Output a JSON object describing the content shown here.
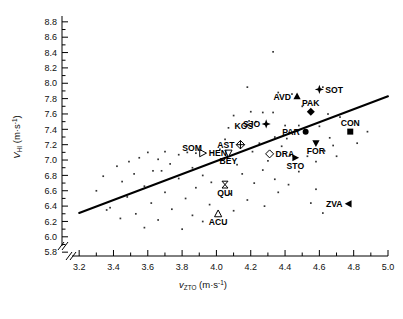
{
  "chart_data": {
    "type": "scatter",
    "title": "",
    "xlabel": "v_ZTO (m·s⁻¹)",
    "ylabel": "V_HI (m·s⁻¹)",
    "xlabel_parts": {
      "main": "v",
      "sub": "ZTO",
      "units": " (m·s",
      "sup": "-1",
      "close": ")"
    },
    "ylabel_parts": {
      "main": "V",
      "sub": "HI",
      "units": " (m·s",
      "sup": "-1",
      "close": ")"
    },
    "xlim": [
      3.1,
      5.0
    ],
    "ylim": [
      5.75,
      8.85
    ],
    "xticks": [
      3.2,
      3.4,
      3.6,
      3.8,
      4.0,
      4.2,
      4.4,
      4.6,
      4.8,
      5.0
    ],
    "xtick_labels": [
      "3.2",
      "3.4",
      "3.6",
      "3.8",
      "4.0",
      "4.2",
      "4.4",
      "4.6",
      "4.8",
      "5.0"
    ],
    "yticks": [
      5.8,
      6.0,
      6.2,
      6.4,
      6.6,
      6.8,
      7.0,
      7.2,
      7.4,
      7.6,
      7.8,
      8.0,
      8.2,
      8.4,
      8.6,
      8.8
    ],
    "ytick_labels": [
      "5.8",
      "6.0",
      "6.2",
      "6.4",
      "6.6",
      "6.8",
      "7.0",
      "7.2",
      "7.4",
      "7.6",
      "7.8",
      "8.0",
      "8.2",
      "8.4",
      "8.6",
      "8.8"
    ],
    "grid": false,
    "legend": "none",
    "axis_break": true,
    "trend_line": {
      "x0": 3.2,
      "y0": 6.31,
      "x1": 5.0,
      "y1": 7.83,
      "width": 2
    },
    "highlighted": [
      {
        "label": "SOT",
        "x": 4.6,
        "y": 7.92,
        "marker": "star-filled",
        "label_pos": "right"
      },
      {
        "label": "AVD",
        "x": 4.47,
        "y": 7.83,
        "marker": "triangle-up-filled",
        "label_pos": "left"
      },
      {
        "label": "PAK",
        "x": 4.55,
        "y": 7.63,
        "marker": "diamond-filled",
        "label_pos": "above"
      },
      {
        "label": "CON",
        "x": 4.78,
        "y": 7.37,
        "marker": "square-filled",
        "label_pos": "above"
      },
      {
        "label": "PAR",
        "x": 4.52,
        "y": 7.37,
        "marker": "circle-filled",
        "label_pos": "left"
      },
      {
        "label": "FOR",
        "x": 4.58,
        "y": 7.22,
        "marker": "triangle-down-filled",
        "label_pos": "below"
      },
      {
        "label": "SJO",
        "x": 4.29,
        "y": 7.47,
        "marker": "star-filled",
        "label_pos": "left"
      },
      {
        "label": "KOS",
        "x": 4.16,
        "y": 7.33,
        "marker": "none",
        "label_pos": "above"
      },
      {
        "label": "AST",
        "x": 4.14,
        "y": 7.2,
        "marker": "diamond-cross",
        "label_pos": "left"
      },
      {
        "label": "SOM",
        "x": 3.95,
        "y": 7.16,
        "marker": "none",
        "label_pos": "left"
      },
      {
        "label": "HEN",
        "x": 3.92,
        "y": 7.09,
        "marker": "triangle-right-open",
        "label_pos": "right"
      },
      {
        "label": "BEY",
        "x": 4.07,
        "y": 7.09,
        "marker": "triangle-down-open",
        "label_pos": "below"
      },
      {
        "label": "DRA",
        "x": 4.31,
        "y": 7.08,
        "marker": "diamond-open",
        "label_pos": "right"
      },
      {
        "label": "STO",
        "x": 4.46,
        "y": 7.03,
        "marker": "triangle-right-filled",
        "label_pos": "below"
      },
      {
        "label": "QUI",
        "x": 4.05,
        "y": 6.68,
        "marker": "bowtie-open",
        "label_pos": "below"
      },
      {
        "label": "ACU",
        "x": 4.01,
        "y": 6.3,
        "marker": "triangle-up-open",
        "label_pos": "below"
      },
      {
        "label": "ZVA",
        "x": 4.77,
        "y": 6.43,
        "marker": "triangle-left-filled",
        "label_pos": "left"
      }
    ],
    "background_points": [
      {
        "x": 4.33,
        "y": 8.41
      },
      {
        "x": 4.18,
        "y": 7.95
      },
      {
        "x": 4.07,
        "y": 7.42
      },
      {
        "x": 4.36,
        "y": 7.88
      },
      {
        "x": 4.44,
        "y": 7.86
      },
      {
        "x": 4.62,
        "y": 7.95
      },
      {
        "x": 4.5,
        "y": 7.7
      },
      {
        "x": 4.2,
        "y": 7.63
      },
      {
        "x": 4.27,
        "y": 7.62
      },
      {
        "x": 4.33,
        "y": 7.62
      },
      {
        "x": 4.1,
        "y": 7.58
      },
      {
        "x": 4.19,
        "y": 7.51
      },
      {
        "x": 4.23,
        "y": 7.5
      },
      {
        "x": 4.65,
        "y": 7.6
      },
      {
        "x": 4.72,
        "y": 7.56
      },
      {
        "x": 4.4,
        "y": 7.45
      },
      {
        "x": 4.48,
        "y": 7.45
      },
      {
        "x": 4.6,
        "y": 7.44
      },
      {
        "x": 4.88,
        "y": 7.37
      },
      {
        "x": 4.34,
        "y": 7.3
      },
      {
        "x": 4.41,
        "y": 7.28
      },
      {
        "x": 4.66,
        "y": 7.29
      },
      {
        "x": 4.05,
        "y": 7.27
      },
      {
        "x": 4.25,
        "y": 7.22
      },
      {
        "x": 4.38,
        "y": 7.18
      },
      {
        "x": 4.68,
        "y": 7.19
      },
      {
        "x": 4.02,
        "y": 7.14
      },
      {
        "x": 4.21,
        "y": 7.11
      },
      {
        "x": 4.63,
        "y": 7.12
      },
      {
        "x": 3.83,
        "y": 7.1
      },
      {
        "x": 3.88,
        "y": 7.09
      },
      {
        "x": 3.7,
        "y": 7.11
      },
      {
        "x": 3.6,
        "y": 7.1
      },
      {
        "x": 3.78,
        "y": 7.07
      },
      {
        "x": 4.43,
        "y": 7.06
      },
      {
        "x": 4.53,
        "y": 7.05
      },
      {
        "x": 3.55,
        "y": 7.03
      },
      {
        "x": 3.66,
        "y": 7.01
      },
      {
        "x": 3.49,
        "y": 6.98
      },
      {
        "x": 3.73,
        "y": 6.95
      },
      {
        "x": 4.3,
        "y": 6.99
      },
      {
        "x": 4.58,
        "y": 6.98
      },
      {
        "x": 3.42,
        "y": 6.92
      },
      {
        "x": 3.86,
        "y": 6.9
      },
      {
        "x": 4.12,
        "y": 6.94
      },
      {
        "x": 3.63,
        "y": 6.86
      },
      {
        "x": 3.68,
        "y": 6.86
      },
      {
        "x": 4.27,
        "y": 6.87
      },
      {
        "x": 3.52,
        "y": 6.82
      },
      {
        "x": 3.92,
        "y": 6.8
      },
      {
        "x": 4.15,
        "y": 6.82
      },
      {
        "x": 4.48,
        "y": 6.85
      },
      {
        "x": 3.34,
        "y": 6.79
      },
      {
        "x": 3.78,
        "y": 6.76
      },
      {
        "x": 4.34,
        "y": 6.75
      },
      {
        "x": 3.45,
        "y": 6.72
      },
      {
        "x": 3.97,
        "y": 6.71
      },
      {
        "x": 4.22,
        "y": 6.7
      },
      {
        "x": 4.42,
        "y": 6.68
      },
      {
        "x": 3.58,
        "y": 6.66
      },
      {
        "x": 3.88,
        "y": 6.64
      },
      {
        "x": 4.58,
        "y": 6.62
      },
      {
        "x": 3.3,
        "y": 6.6
      },
      {
        "x": 3.7,
        "y": 6.58
      },
      {
        "x": 4.08,
        "y": 6.56
      },
      {
        "x": 4.36,
        "y": 6.58
      },
      {
        "x": 3.48,
        "y": 6.52
      },
      {
        "x": 3.82,
        "y": 6.5
      },
      {
        "x": 4.18,
        "y": 6.48
      },
      {
        "x": 3.62,
        "y": 6.44
      },
      {
        "x": 3.96,
        "y": 6.42
      },
      {
        "x": 4.28,
        "y": 6.4
      },
      {
        "x": 4.55,
        "y": 6.44
      },
      {
        "x": 3.38,
        "y": 6.38
      },
      {
        "x": 3.74,
        "y": 6.36
      },
      {
        "x": 4.1,
        "y": 6.34
      },
      {
        "x": 3.53,
        "y": 6.3
      },
      {
        "x": 3.86,
        "y": 6.28
      },
      {
        "x": 4.62,
        "y": 6.31
      },
      {
        "x": 3.44,
        "y": 6.24
      },
      {
        "x": 3.66,
        "y": 6.22
      },
      {
        "x": 3.92,
        "y": 6.2
      },
      {
        "x": 3.58,
        "y": 6.12
      },
      {
        "x": 3.8,
        "y": 6.1
      },
      {
        "x": 3.36,
        "y": 6.35
      },
      {
        "x": 4.7,
        "y": 7.05
      },
      {
        "x": 4.82,
        "y": 7.22
      }
    ]
  }
}
